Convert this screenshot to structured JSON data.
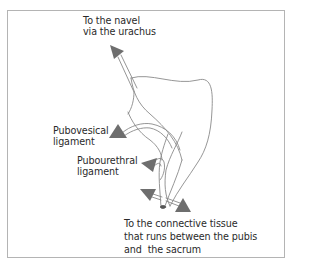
{
  "diagram": {
    "labels": {
      "navel": {
        "line1": "To the navel",
        "line2": "via the urachus"
      },
      "pubovesical": {
        "line1": "Pubovesical",
        "line2": "ligament"
      },
      "pubourethral": {
        "line1": "Pubourethral",
        "line2": "ligament"
      },
      "connective": {
        "line1": "To the connective tissue",
        "line2": "that runs between the pubis",
        "line3": "and  the sacrum"
      }
    },
    "colors": {
      "frame": "#b4b4b4",
      "outline": "#8a8a8a",
      "arrow": "#6e6e6e",
      "text": "#2a2a2a"
    }
  }
}
